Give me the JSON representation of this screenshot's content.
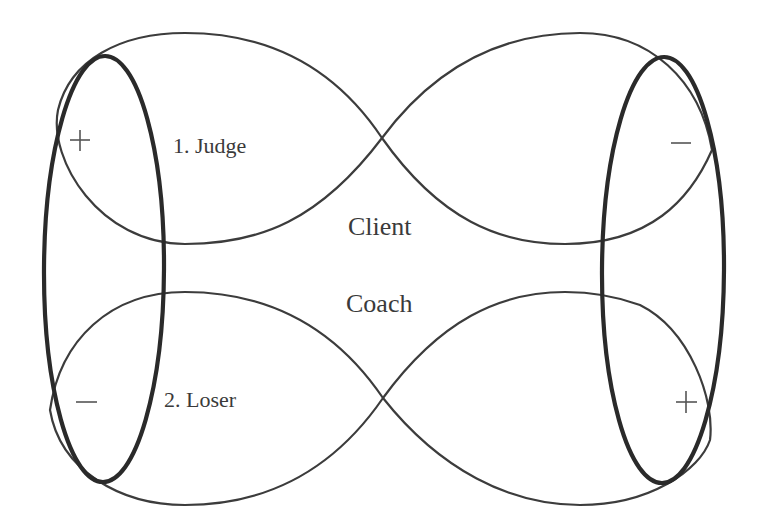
{
  "diagram": {
    "labels": {
      "judge": "1. Judge",
      "loser": "2. Loser",
      "client": "Client",
      "coach": "Coach"
    },
    "signs": {
      "top_left": "+",
      "top_right": "−",
      "bottom_left": "−",
      "bottom_right": "+"
    },
    "colors": {
      "stroke": "#2a2a2a",
      "text": "#3a3a3a",
      "background": "#ffffff"
    }
  }
}
